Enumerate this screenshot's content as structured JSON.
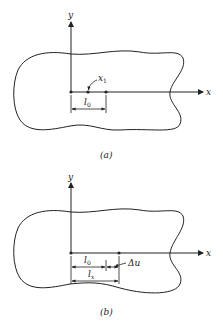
{
  "figure_a": {
    "caption": "(a)",
    "axis_x_label": "x",
    "axis_y_label": "y",
    "point_label": "x",
    "point_label_sub": "1",
    "dimension_label": "l",
    "dimension_label_sub": "0"
  },
  "figure_b": {
    "caption": "(b)",
    "axis_x_label": "x",
    "axis_y_label": "y",
    "dim1_label": "l",
    "dim1_label_sub": "0",
    "dim2_label": "l",
    "dim2_label_sub": "x",
    "delta_label": "Δu"
  },
  "colors": {
    "stroke": "#222222",
    "background": "#ffffff"
  }
}
